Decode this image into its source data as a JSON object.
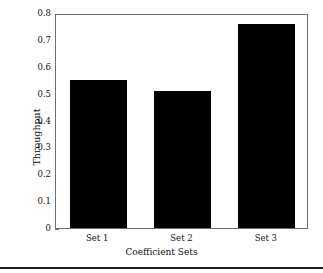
{
  "chart_data": {
    "type": "bar",
    "title": "",
    "subtitle": "",
    "categories": [
      "Set 1",
      "Set 2",
      "Set 3"
    ],
    "values": [
      0.55,
      0.51,
      0.76
    ],
    "xlabel": "Coefficient Sets",
    "ylabel": "Throughput",
    "ylim": [
      0,
      0.8
    ],
    "yticks": [
      "0",
      "0.1",
      "0.2",
      "0.3",
      "0.4",
      "0.5",
      "0.6",
      "0.7",
      "0.8"
    ],
    "ytick_values": [
      0,
      0.1,
      0.2,
      0.3,
      0.4,
      0.5,
      0.6,
      0.7,
      0.8
    ],
    "grid": false,
    "legend": null,
    "legend_position": "none",
    "bar_color": "#000000",
    "frame_color": "#6e6e6e",
    "background": "#ffffff",
    "tick_direction": "in",
    "annotations": []
  },
  "figure": {
    "footer_rule_color": "#1c1c1c"
  }
}
